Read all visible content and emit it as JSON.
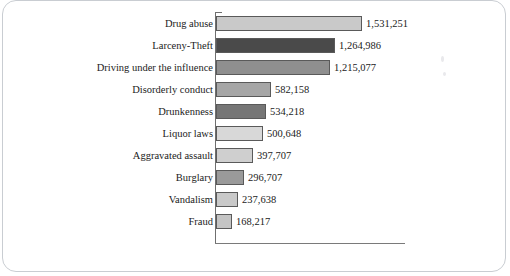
{
  "figure": {
    "background_color": "#ffffff",
    "frame_color": "#c9cdd2",
    "axis_color": "#6f6f6f"
  },
  "chart_data": {
    "type": "bar",
    "orientation": "horizontal",
    "title": "",
    "subtitle": "",
    "xlabel": "",
    "ylabel": "",
    "grid": false,
    "legend": "none",
    "xlim": [
      0,
      1700000
    ],
    "categories": [
      "Drug abuse",
      "Larceny-Theft",
      "Driving under the influence",
      "Disorderly conduct",
      "Drunkenness",
      "Liquor laws",
      "Aggravated assault",
      "Burglary",
      "Vandalism",
      "Fraud"
    ],
    "values": [
      1531251,
      1264986,
      1215077,
      582158,
      534218,
      500648,
      397707,
      296707,
      237638,
      168217
    ],
    "value_labels": [
      "1,531,251",
      "1,264,986",
      "1,215,077",
      "582,158",
      "534,218",
      "500,648",
      "397,707",
      "296,707",
      "237,638",
      "168,217"
    ],
    "bar_colors": [
      "#c9c9c9",
      "#4a4a4a",
      "#8f8f8f",
      "#a6a6a6",
      "#767676",
      "#d8d8d8",
      "#cfcfcf",
      "#9a9a9a",
      "#c9c9c9",
      "#c4c4c4"
    ],
    "bar_edge_color": "#5a5a5a"
  },
  "bars": [
    {
      "label": "Drug abuse",
      "value_label": "1,531,251",
      "px_width": 146,
      "color": "#c9c9c9"
    },
    {
      "label": "Larceny-Theft",
      "value_label": "1,264,986",
      "px_width": 119,
      "color": "#4a4a4a"
    },
    {
      "label": "Driving under the influence",
      "value_label": "1,215,077",
      "px_width": 114,
      "color": "#8f8f8f"
    },
    {
      "label": "Disorderly conduct",
      "value_label": "582,158",
      "px_width": 55,
      "color": "#a6a6a6"
    },
    {
      "label": "Drunkenness",
      "value_label": "534,218",
      "px_width": 50,
      "color": "#767676"
    },
    {
      "label": "Liquor laws",
      "value_label": "500,648",
      "px_width": 47,
      "color": "#d8d8d8"
    },
    {
      "label": "Aggravated assault",
      "value_label": "397,707",
      "px_width": 37,
      "color": "#cfcfcf"
    },
    {
      "label": "Burglary",
      "value_label": "296,707",
      "px_width": 28,
      "color": "#9a9a9a"
    },
    {
      "label": "Vandalism",
      "value_label": "237,638",
      "px_width": 22,
      "color": "#c9c9c9"
    },
    {
      "label": "Fraud",
      "value_label": "168,217",
      "px_width": 16,
      "color": "#c4c4c4"
    }
  ]
}
